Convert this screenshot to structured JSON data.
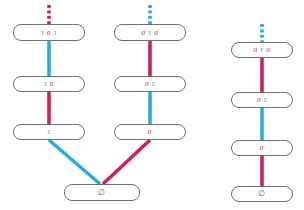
{
  "figure": {
    "type": "hasse-diagram",
    "background": "#ffffff",
    "colors": {
      "tau": "#2aabe2",
      "sigma": "#d21e61",
      "node_border": "#6d6e71",
      "node_fill": "#ffffff",
      "empty_text": "#58595b"
    }
  },
  "components": [
    {
      "id": "left-chain",
      "nodes": [
        {
          "id": "L1",
          "label": "τ σ τ",
          "tokens": [
            {
              "text": "τ",
              "color_role": "tau"
            },
            {
              "text": "σ",
              "color_role": "sigma"
            },
            {
              "text": "τ",
              "color_role": "tau"
            }
          ]
        },
        {
          "id": "L2",
          "label": "τ σ",
          "tokens": [
            {
              "text": "τ",
              "color_role": "tau"
            },
            {
              "text": "σ",
              "color_role": "sigma"
            }
          ]
        },
        {
          "id": "L3",
          "label": "τ",
          "tokens": [
            {
              "text": "τ",
              "color_role": "tau"
            }
          ]
        }
      ],
      "edges": [
        {
          "from": "top-dashed",
          "to": "L1",
          "color_role": "sigma",
          "style": "dashed"
        },
        {
          "from": "L1",
          "to": "L2",
          "color_role": "tau",
          "style": "solid"
        },
        {
          "from": "L2",
          "to": "L3",
          "color_role": "sigma",
          "style": "solid"
        },
        {
          "from": "L3",
          "to": "BOTTOM",
          "color_role": "tau",
          "style": "solid"
        }
      ]
    },
    {
      "id": "middle-chain",
      "nodes": [
        {
          "id": "M1",
          "label": "σ τ σ",
          "tokens": [
            {
              "text": "σ",
              "color_role": "sigma"
            },
            {
              "text": "τ",
              "color_role": "tau"
            },
            {
              "text": "σ",
              "color_role": "sigma"
            }
          ]
        },
        {
          "id": "M2",
          "label": "σ τ",
          "tokens": [
            {
              "text": "σ",
              "color_role": "sigma"
            },
            {
              "text": "τ",
              "color_role": "tau"
            }
          ]
        },
        {
          "id": "M3",
          "label": "σ",
          "tokens": [
            {
              "text": "σ",
              "color_role": "sigma"
            }
          ]
        }
      ],
      "edges": [
        {
          "from": "top-dashed",
          "to": "M1",
          "color_role": "tau",
          "style": "dashed"
        },
        {
          "from": "M1",
          "to": "M2",
          "color_role": "sigma",
          "style": "solid"
        },
        {
          "from": "M2",
          "to": "M3",
          "color_role": "tau",
          "style": "solid"
        },
        {
          "from": "M3",
          "to": "BOTTOM",
          "color_role": "sigma",
          "style": "solid"
        }
      ]
    },
    {
      "id": "bottom-node",
      "nodes": [
        {
          "id": "BOTTOM",
          "label": "∅",
          "tokens": [
            {
              "text": "∅",
              "color_role": "empty"
            }
          ]
        }
      ]
    },
    {
      "id": "right-chain",
      "nodes": [
        {
          "id": "R1",
          "label": "σ τ σ",
          "tokens": [
            {
              "text": "σ",
              "color_role": "sigma"
            },
            {
              "text": "τ",
              "color_role": "tau"
            },
            {
              "text": "σ",
              "color_role": "sigma"
            }
          ]
        },
        {
          "id": "R2",
          "label": "σ τ",
          "tokens": [
            {
              "text": "σ",
              "color_role": "sigma"
            },
            {
              "text": "τ",
              "color_role": "tau"
            }
          ]
        },
        {
          "id": "R3",
          "label": "σ",
          "tokens": [
            {
              "text": "σ",
              "color_role": "sigma"
            }
          ]
        },
        {
          "id": "R4",
          "label": "∅",
          "tokens": [
            {
              "text": "∅",
              "color_role": "empty"
            }
          ]
        }
      ],
      "edges": [
        {
          "from": "top-dashed",
          "to": "R1",
          "color_role": "tau",
          "style": "dashed"
        },
        {
          "from": "R1",
          "to": "R2",
          "color_role": "sigma",
          "style": "solid"
        },
        {
          "from": "R2",
          "to": "R3",
          "color_role": "tau",
          "style": "solid"
        },
        {
          "from": "R3",
          "to": "R4",
          "color_role": "sigma",
          "style": "solid"
        }
      ]
    }
  ],
  "labels": {
    "L1": "τ σ τ",
    "L2": "τ σ",
    "L3": "τ",
    "M1": "σ τ σ",
    "M2": "σ τ",
    "M3": "σ",
    "BOTTOM": "∅",
    "R1": "σ τ σ",
    "R2": "σ τ",
    "R3": "σ",
    "R4": "∅"
  }
}
